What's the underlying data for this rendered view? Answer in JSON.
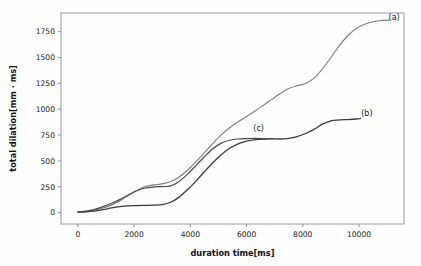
{
  "chart_data": {
    "type": "line",
    "title": "",
    "xlabel": "duration time[ms]",
    "ylabel": "total dilation[mm · ms]",
    "xlim": [
      -600,
      11600
    ],
    "ylim": [
      -110,
      1930
    ],
    "xticks": [
      0,
      2000,
      4000,
      6000,
      8000,
      10000
    ],
    "xticklabels": [
      "0",
      "2000",
      "4000",
      "6000",
      "8000",
      "10000"
    ],
    "yticks": [
      0,
      250,
      500,
      750,
      1000,
      1250,
      1500,
      1750
    ],
    "yticklabels": [
      "0",
      "250",
      "500",
      "750",
      "1000",
      "1250",
      "1500",
      "1750"
    ],
    "grid": false,
    "legend_position": "inline-annotations",
    "series": [
      {
        "name": "(a)",
        "label": "(a)",
        "color": "#7d7d7d",
        "width": 1.1,
        "annotation": {
          "text": "(a)",
          "x": 11250,
          "y": 1865
        },
        "points": [
          [
            0,
            5
          ],
          [
            300,
            12
          ],
          [
            600,
            25
          ],
          [
            900,
            45
          ],
          [
            1200,
            75
          ],
          [
            1500,
            115
          ],
          [
            1800,
            165
          ],
          [
            2100,
            215
          ],
          [
            2400,
            252
          ],
          [
            2700,
            268
          ],
          [
            3000,
            278
          ],
          [
            3300,
            300
          ],
          [
            3600,
            345
          ],
          [
            3900,
            410
          ],
          [
            4200,
            490
          ],
          [
            4500,
            580
          ],
          [
            4800,
            670
          ],
          [
            5100,
            752
          ],
          [
            5400,
            820
          ],
          [
            5700,
            878
          ],
          [
            6000,
            930
          ],
          [
            6300,
            982
          ],
          [
            6600,
            1038
          ],
          [
            6900,
            1095
          ],
          [
            7200,
            1152
          ],
          [
            7500,
            1200
          ],
          [
            7800,
            1228
          ],
          [
            8100,
            1248
          ],
          [
            8400,
            1300
          ],
          [
            8700,
            1390
          ],
          [
            9000,
            1500
          ],
          [
            9300,
            1615
          ],
          [
            9600,
            1710
          ],
          [
            9900,
            1780
          ],
          [
            10200,
            1822
          ],
          [
            10500,
            1845
          ],
          [
            10800,
            1857
          ],
          [
            11100,
            1862
          ]
        ]
      },
      {
        "name": "(b)",
        "label": "(b)",
        "color": "#3a3a3a",
        "width": 1.3,
        "annotation": {
          "text": "(b)",
          "x": 10280,
          "y": 930
        },
        "points": [
          [
            0,
            4
          ],
          [
            300,
            8
          ],
          [
            600,
            15
          ],
          [
            900,
            28
          ],
          [
            1200,
            45
          ],
          [
            1500,
            58
          ],
          [
            1800,
            65
          ],
          [
            2100,
            68
          ],
          [
            2400,
            70
          ],
          [
            2700,
            72
          ],
          [
            3000,
            78
          ],
          [
            3300,
            100
          ],
          [
            3600,
            150
          ],
          [
            3900,
            222
          ],
          [
            4200,
            305
          ],
          [
            4500,
            395
          ],
          [
            4800,
            482
          ],
          [
            5100,
            560
          ],
          [
            5400,
            622
          ],
          [
            5700,
            665
          ],
          [
            6000,
            692
          ],
          [
            6300,
            705
          ],
          [
            6600,
            712
          ],
          [
            6900,
            714
          ],
          [
            7200,
            712
          ],
          [
            7500,
            718
          ],
          [
            7800,
            735
          ],
          [
            8100,
            765
          ],
          [
            8400,
            805
          ],
          [
            8700,
            855
          ],
          [
            9000,
            888
          ],
          [
            9300,
            896
          ],
          [
            9600,
            900
          ],
          [
            9900,
            905
          ],
          [
            10050,
            910
          ]
        ]
      },
      {
        "name": "(c)",
        "label": "(c)",
        "color": "#4a4a4a",
        "width": 1.2,
        "annotation": {
          "text": "(c)",
          "x": 6430,
          "y": 790
        },
        "points": [
          [
            0,
            5
          ],
          [
            300,
            14
          ],
          [
            600,
            32
          ],
          [
            900,
            58
          ],
          [
            1200,
            90
          ],
          [
            1500,
            128
          ],
          [
            1800,
            172
          ],
          [
            2100,
            212
          ],
          [
            2400,
            238
          ],
          [
            2700,
            248
          ],
          [
            3000,
            252
          ],
          [
            3300,
            258
          ],
          [
            3600,
            300
          ],
          [
            3900,
            372
          ],
          [
            4200,
            455
          ],
          [
            4500,
            540
          ],
          [
            4800,
            618
          ],
          [
            5100,
            672
          ],
          [
            5400,
            700
          ],
          [
            5700,
            712
          ],
          [
            6000,
            716
          ],
          [
            6300,
            718
          ],
          [
            6600,
            716
          ],
          [
            6750,
            712
          ]
        ]
      }
    ]
  }
}
